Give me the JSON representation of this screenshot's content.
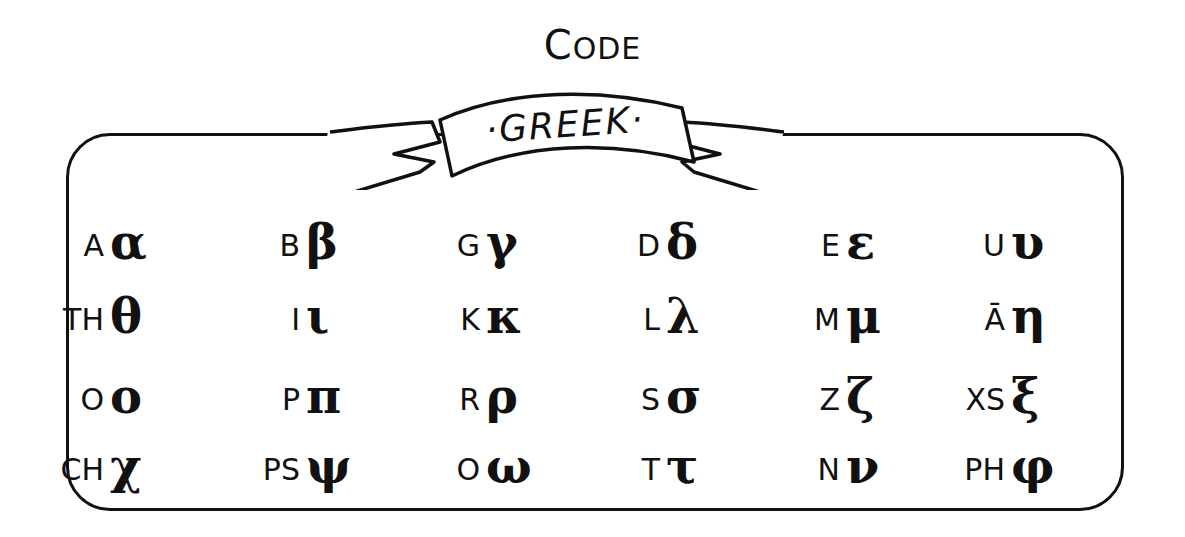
{
  "title": {
    "first_letter": "C",
    "rest": "ODE"
  },
  "banner": {
    "label": "·GREEK·"
  },
  "rows": [
    [
      {
        "latin": "A",
        "greek": "α"
      },
      {
        "latin": "B",
        "greek": "β"
      },
      {
        "latin": "G",
        "greek": "γ"
      },
      {
        "latin": "D",
        "greek": "δ"
      },
      {
        "latin": "E",
        "greek": "ε"
      },
      {
        "latin": "U",
        "greek": "υ"
      }
    ],
    [
      {
        "latin": "TH",
        "greek": "θ"
      },
      {
        "latin": "I",
        "greek": "ι"
      },
      {
        "latin": "K",
        "greek": "κ"
      },
      {
        "latin": "L",
        "greek": "λ"
      },
      {
        "latin": "M",
        "greek": "μ"
      },
      {
        "latin": "Ā",
        "greek": "η"
      }
    ],
    [
      {
        "latin": "O",
        "greek": "ο"
      },
      {
        "latin": "P",
        "greek": "π"
      },
      {
        "latin": "R",
        "greek": "ρ"
      },
      {
        "latin": "S",
        "greek": "σ"
      },
      {
        "latin": "Z",
        "greek": "ζ"
      },
      {
        "latin": "XS",
        "greek": "ξ"
      }
    ],
    [
      {
        "latin": "CH",
        "greek": "χ"
      },
      {
        "latin": "PS",
        "greek": "ψ"
      },
      {
        "latin": "O",
        "greek": "ω"
      },
      {
        "latin": "T",
        "greek": "τ"
      },
      {
        "latin": "N",
        "greek": "ν"
      },
      {
        "latin": "PH",
        "greek": "φ"
      }
    ]
  ]
}
